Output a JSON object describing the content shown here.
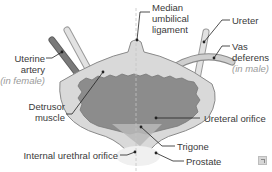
{
  "diagram": {
    "labels": {
      "median_umbilical_ligament": [
        "Median",
        "umbilical",
        "ligament"
      ],
      "ureter": "Ureter",
      "vas_deferens": [
        "Vas",
        "deferens"
      ],
      "vas_deferens_note": "(in male)",
      "uterine_artery": [
        "Uterine",
        "artery"
      ],
      "uterine_artery_note": "(in female)",
      "detrusor_muscle": [
        "Detrusor",
        "muscle"
      ],
      "ureteral_orifice": "Ureteral orifice",
      "trigone": "Trigone",
      "internal_urethral_orifice": "Internal urethral orifice",
      "prostate": "Prostate"
    },
    "colors": {
      "bladder_wall": "#d9d9d9",
      "bladder_outline": "#8a8a8a",
      "mucosa": "#8c8c8c",
      "mucosa_dark": "#7a7a7a",
      "tube": "#c8c8c8",
      "tube_dark": "#6e6e6e",
      "leader": "#222222",
      "text": "#3a3a3a",
      "note_text": "#9a9a9a"
    }
  },
  "controls": {
    "expand_icon": "expand-icon"
  }
}
